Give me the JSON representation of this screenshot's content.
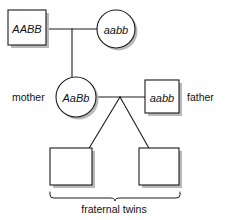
{
  "diagram": {
    "colors": {
      "background": "#ffffff",
      "stroke": "#1a1a1a",
      "shadow": "#b9b9b9",
      "text": "#111111"
    },
    "generation1": {
      "maternal_grandfather": {
        "shape": "square",
        "genotype": "AABB",
        "x": 8,
        "y": 10,
        "w": 38,
        "h": 35
      },
      "maternal_grandmother": {
        "shape": "circle",
        "genotype": "aabb",
        "cx": 116,
        "cy": 29,
        "r": 19
      },
      "mating_line": {
        "x1": 46,
        "x2": 97,
        "y": 29
      },
      "descent_line": {
        "x": 72,
        "y1": 29,
        "y2": 78
      }
    },
    "generation2": {
      "mother": {
        "shape": "circle",
        "genotype": "AaBb",
        "role_label": "mother",
        "cx": 76,
        "cy": 97,
        "r": 20,
        "label_x": 12,
        "label_y": 97
      },
      "father": {
        "shape": "square",
        "genotype": "aabb",
        "role_label": "father",
        "x": 145,
        "y": 80,
        "w": 34,
        "h": 33,
        "label_x": 187,
        "label_y": 97
      },
      "mating_line": {
        "x1": 96,
        "x2": 145,
        "y": 97
      },
      "sibship_apex": {
        "x": 120,
        "y": 97
      }
    },
    "generation3": {
      "twins": [
        {
          "shape": "square",
          "genotype": "",
          "x": 50,
          "y": 148,
          "w": 42,
          "h": 37
        },
        {
          "shape": "square",
          "genotype": "",
          "x": 139,
          "y": 148,
          "w": 40,
          "h": 37
        }
      ],
      "caption": "fraternal twins",
      "caption_x": 114,
      "caption_y": 209,
      "brace": {
        "x1": 50,
        "x2": 180,
        "y": 192,
        "mid_x": 115
      }
    }
  }
}
